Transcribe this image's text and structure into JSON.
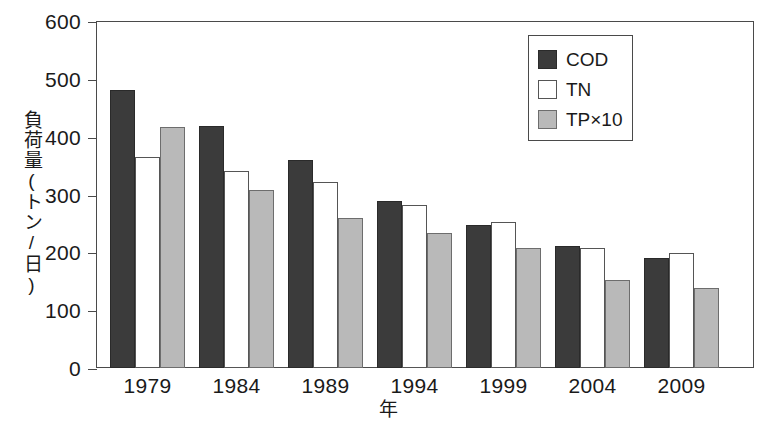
{
  "chart_data": {
    "type": "bar",
    "title": "",
    "xlabel": "年",
    "ylabel": "負荷量(トン/日)",
    "ylim": [
      0,
      600
    ],
    "ytick_step": 100,
    "yticks": [
      0,
      100,
      200,
      300,
      400,
      500,
      600
    ],
    "ytick_labels": [
      "0",
      "100",
      "200",
      "300",
      "400",
      "500",
      "600"
    ],
    "categories": [
      "1979",
      "1984",
      "1989",
      "1994",
      "1999",
      "2004",
      "2009"
    ],
    "grid": false,
    "legend_position": "top-right",
    "series": [
      {
        "name": "COD",
        "color": "#3b3b3b",
        "values": [
          481,
          418,
          360,
          289,
          247,
          211,
          191
        ]
      },
      {
        "name": "TN",
        "color": "#ffffff",
        "values": [
          365,
          340,
          322,
          282,
          253,
          208,
          199
        ]
      },
      {
        "name": "TP×10",
        "color": "#b9b9b9",
        "values": [
          417,
          307,
          259,
          233,
          208,
          152,
          138
        ]
      }
    ]
  },
  "legend": {
    "items": [
      {
        "label": "COD",
        "swatch": "cod"
      },
      {
        "label": "TN",
        "swatch": "tn"
      },
      {
        "label": "TP×10",
        "swatch": "tp"
      }
    ]
  },
  "axes": {
    "y_title": "負荷量(トン/日)",
    "x_title": "年"
  }
}
